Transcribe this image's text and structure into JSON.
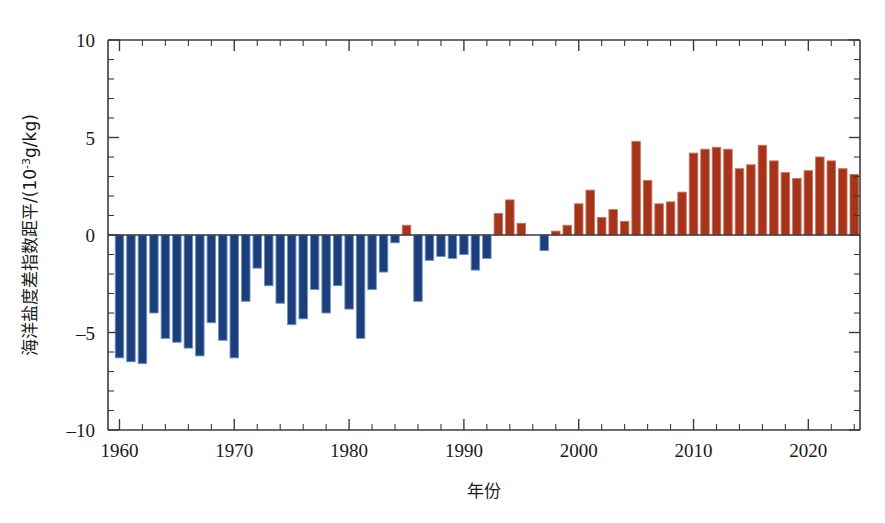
{
  "chart_data": {
    "type": "bar",
    "title": "",
    "xlabel": "年份",
    "ylabel": "海洋盐度差指数距平/(10⁻³g/kg)",
    "ylabel_parts": {
      "prefix": "海洋盐度差指数距平/(10",
      "exponent": "-3",
      "suffix": "g/kg)"
    },
    "xlim": [
      1959,
      2024.5
    ],
    "ylim": [
      -10,
      10
    ],
    "yticks": [
      -10,
      -5,
      0,
      5,
      10
    ],
    "ytick_labels": [
      "-10",
      "-5",
      "0",
      "5",
      "10"
    ],
    "y_minor_tick_step": 1,
    "xticks": [
      1960,
      1970,
      1980,
      1990,
      2000,
      2010,
      2020
    ],
    "xtick_labels": [
      "1960",
      "1970",
      "1980",
      "1990",
      "2000",
      "2010",
      "2020"
    ],
    "x_minor_tick_step": 2,
    "grid": false,
    "legend": null,
    "colors": {
      "negative": "#1c3f7c",
      "positive": "#a8331b",
      "axis": "#3a3a42",
      "bar_edge_negative": "#6d93c4",
      "bar_edge_positive": "#c6765c"
    },
    "bar_edge_color_note": "light outline around each bar",
    "x": [
      1960,
      1961,
      1962,
      1963,
      1964,
      1965,
      1966,
      1967,
      1968,
      1969,
      1970,
      1971,
      1972,
      1973,
      1974,
      1975,
      1976,
      1977,
      1978,
      1979,
      1980,
      1981,
      1982,
      1983,
      1984,
      1985,
      1986,
      1987,
      1988,
      1989,
      1990,
      1991,
      1992,
      1993,
      1994,
      1995,
      1996,
      1997,
      1998,
      1999,
      2000,
      2001,
      2002,
      2003,
      2004,
      2005,
      2006,
      2007,
      2008,
      2009,
      2010,
      2011,
      2012,
      2013,
      2014,
      2015,
      2016,
      2017,
      2018,
      2019,
      2020,
      2021,
      2022,
      2023,
      2024
    ],
    "values": [
      -6.3,
      -6.5,
      -6.6,
      -4.0,
      -5.3,
      -5.5,
      -5.8,
      -6.2,
      -4.5,
      -5.4,
      -6.3,
      -3.4,
      -1.7,
      -2.6,
      -3.5,
      -4.6,
      -4.3,
      -2.8,
      -4.0,
      -2.6,
      -3.8,
      -5.3,
      -2.8,
      -1.9,
      -0.4,
      0.5,
      -3.4,
      -1.3,
      -1.1,
      -1.2,
      -1.0,
      -1.8,
      -1.2,
      1.1,
      1.8,
      0.6,
      0.0,
      -0.8,
      0.2,
      0.5,
      1.6,
      2.3,
      0.9,
      1.3,
      0.7,
      4.8,
      2.8,
      1.6,
      1.7,
      2.2,
      4.2,
      4.4,
      4.5,
      4.4,
      3.4,
      3.6,
      4.6,
      3.8,
      3.2,
      2.9,
      3.3,
      4.0,
      3.8,
      3.4,
      3.1
    ],
    "series": [
      {
        "name": "海洋盐度差指数距平",
        "values": [
          -6.3,
          -6.5,
          -6.6,
          -4.0,
          -5.3,
          -5.5,
          -5.8,
          -6.2,
          -4.5,
          -5.4,
          -6.3,
          -3.4,
          -1.7,
          -2.6,
          -3.5,
          -4.6,
          -4.3,
          -2.8,
          -4.0,
          -2.6,
          -3.8,
          -5.3,
          -2.8,
          -1.9,
          -0.4,
          0.5,
          -3.4,
          -1.3,
          -1.1,
          -1.2,
          -1.0,
          -1.8,
          -1.2,
          1.1,
          1.8,
          0.6,
          0.0,
          -0.8,
          0.2,
          0.5,
          1.6,
          2.3,
          0.9,
          1.3,
          0.7,
          4.8,
          2.8,
          1.6,
          1.7,
          2.2,
          4.2,
          4.4,
          4.5,
          4.4,
          3.4,
          3.6,
          4.6,
          3.8,
          3.2,
          2.9,
          3.3,
          4.0,
          3.8,
          3.4,
          3.1
        ]
      }
    ]
  }
}
